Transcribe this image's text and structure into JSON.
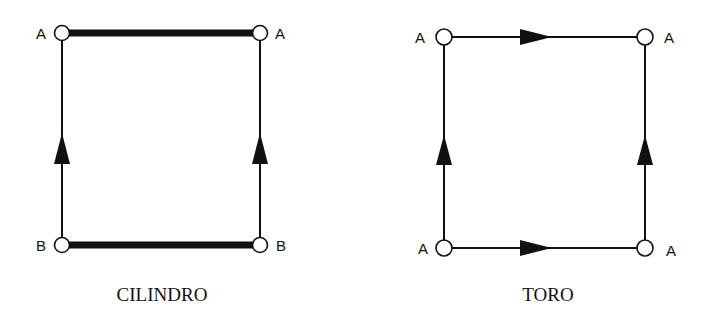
{
  "diagrams": [
    {
      "name": "cilindro",
      "caption": "CILINDRO",
      "vertices": {
        "top_left": {
          "label": "A",
          "x": 62,
          "y": 33
        },
        "top_right": {
          "label": "A",
          "x": 260,
          "y": 33
        },
        "bottom_left": {
          "label": "B",
          "x": 62,
          "y": 245
        },
        "bottom_right": {
          "label": "B",
          "x": 260,
          "y": 245
        }
      },
      "edges": [
        {
          "name": "top",
          "style": "thick",
          "arrow": "none"
        },
        {
          "name": "bottom",
          "style": "thick",
          "arrow": "none"
        },
        {
          "name": "left",
          "style": "thin",
          "arrow": "up"
        },
        {
          "name": "right",
          "style": "thin",
          "arrow": "up"
        }
      ]
    },
    {
      "name": "toro",
      "caption": "TORO",
      "vertices": {
        "top_left": {
          "label": "A",
          "x": 444,
          "y": 37
        },
        "top_right": {
          "label": "A",
          "x": 645,
          "y": 37
        },
        "bottom_left": {
          "label": "A",
          "x": 444,
          "y": 248
        },
        "bottom_right": {
          "label": "A",
          "x": 645,
          "y": 248
        }
      },
      "edges": [
        {
          "name": "top",
          "style": "thin",
          "arrow": "right"
        },
        {
          "name": "bottom",
          "style": "thin",
          "arrow": "right"
        },
        {
          "name": "left",
          "style": "thin",
          "arrow": "up"
        },
        {
          "name": "right",
          "style": "thin",
          "arrow": "up"
        }
      ]
    }
  ]
}
